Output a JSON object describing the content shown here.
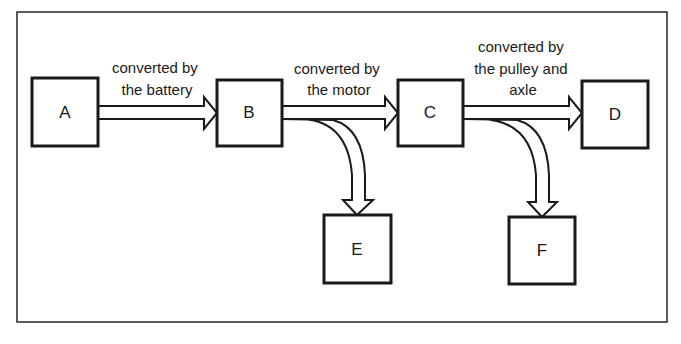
{
  "diagram": {
    "type": "energy-flow",
    "nodes": [
      {
        "id": "A",
        "label": "A"
      },
      {
        "id": "B",
        "label": "B"
      },
      {
        "id": "C",
        "label": "C"
      },
      {
        "id": "D",
        "label": "D"
      },
      {
        "id": "E",
        "label": "E"
      },
      {
        "id": "F",
        "label": "F"
      }
    ],
    "edges": [
      {
        "from": "A",
        "to": "B",
        "label_lines": [
          "converted by",
          "the battery"
        ]
      },
      {
        "from": "B",
        "to": "C",
        "label_lines": [
          "converted by",
          "the motor"
        ]
      },
      {
        "from": "B",
        "to": "E",
        "label_lines": []
      },
      {
        "from": "C",
        "to": "D",
        "label_lines": [
          "converted by",
          "the pulley and",
          "axle"
        ]
      },
      {
        "from": "C",
        "to": "F",
        "label_lines": []
      }
    ]
  },
  "colors": {
    "stroke": "#1a1a1a",
    "background": "#ffffff"
  }
}
